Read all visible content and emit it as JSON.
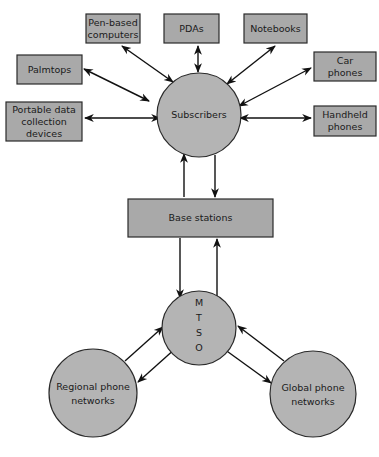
{
  "diagram": {
    "nodes": {
      "pen_based": {
        "lines": [
          "Pen-based",
          "computers"
        ]
      },
      "pdas": {
        "lines": [
          "PDAs"
        ]
      },
      "notebooks": {
        "lines": [
          "Notebooks"
        ]
      },
      "palmtops": {
        "lines": [
          "Palmtops"
        ]
      },
      "car_phones": {
        "lines": [
          "Car",
          "phones"
        ]
      },
      "portable_data": {
        "lines": [
          "Portable data",
          "collection",
          "devices"
        ]
      },
      "handheld_phones": {
        "lines": [
          "Handheld",
          "phones"
        ]
      },
      "subscribers": {
        "lines": [
          "Subscribers"
        ]
      },
      "base_stations": {
        "lines": [
          "Base stations"
        ]
      },
      "mtso": {
        "lines": [
          "M",
          "T",
          "S",
          "O"
        ]
      },
      "regional": {
        "lines": [
          "Regional phone",
          "networks"
        ]
      },
      "global": {
        "lines": [
          "Global phone",
          "networks"
        ]
      }
    },
    "edges": [
      {
        "from": "pen_based",
        "to": "subscribers",
        "type": "bidirectional"
      },
      {
        "from": "pdas",
        "to": "subscribers",
        "type": "bidirectional"
      },
      {
        "from": "notebooks",
        "to": "subscribers",
        "type": "bidirectional"
      },
      {
        "from": "palmtops",
        "to": "subscribers",
        "type": "bidirectional"
      },
      {
        "from": "car_phones",
        "to": "subscribers",
        "type": "bidirectional"
      },
      {
        "from": "portable_data",
        "to": "subscribers",
        "type": "bidirectional"
      },
      {
        "from": "handheld_phones",
        "to": "subscribers",
        "type": "bidirectional"
      },
      {
        "from": "base_stations",
        "to": "subscribers",
        "type": "directed"
      },
      {
        "from": "subscribers",
        "to": "base_stations",
        "type": "directed"
      },
      {
        "from": "base_stations",
        "to": "mtso",
        "type": "directed"
      },
      {
        "from": "mtso",
        "to": "base_stations",
        "type": "directed"
      },
      {
        "from": "regional",
        "to": "mtso",
        "type": "directed"
      },
      {
        "from": "mtso",
        "to": "regional",
        "type": "directed"
      },
      {
        "from": "mtso",
        "to": "global",
        "type": "directed"
      },
      {
        "from": "global",
        "to": "mtso",
        "type": "directed"
      }
    ],
    "colors": {
      "box_fill": "#a9a9a9",
      "circle_fill": "#b4b4b4",
      "stroke": "#2a2a2a"
    }
  }
}
